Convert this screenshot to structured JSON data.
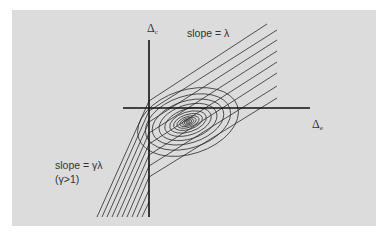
{
  "diagram": {
    "background_color": "#ffffff",
    "panel_color": "#dcdcdc",
    "line_color": "#2a2a2a",
    "axes": {
      "vertical_label_symbol": "Δ",
      "vertical_label_sub": "c",
      "horizontal_label_symbol": "Δ",
      "horizontal_label_sub": "e"
    },
    "annotations": {
      "upper_slope": "slope = λ",
      "lower_slope": "slope = γλ",
      "lower_condition": "(γ>1)"
    },
    "ellipses": {
      "center": [
        188,
        122
      ],
      "rotation_deg": -18,
      "count": 12
    },
    "upper_lines_count": 8,
    "lower_lines_count": 10
  }
}
